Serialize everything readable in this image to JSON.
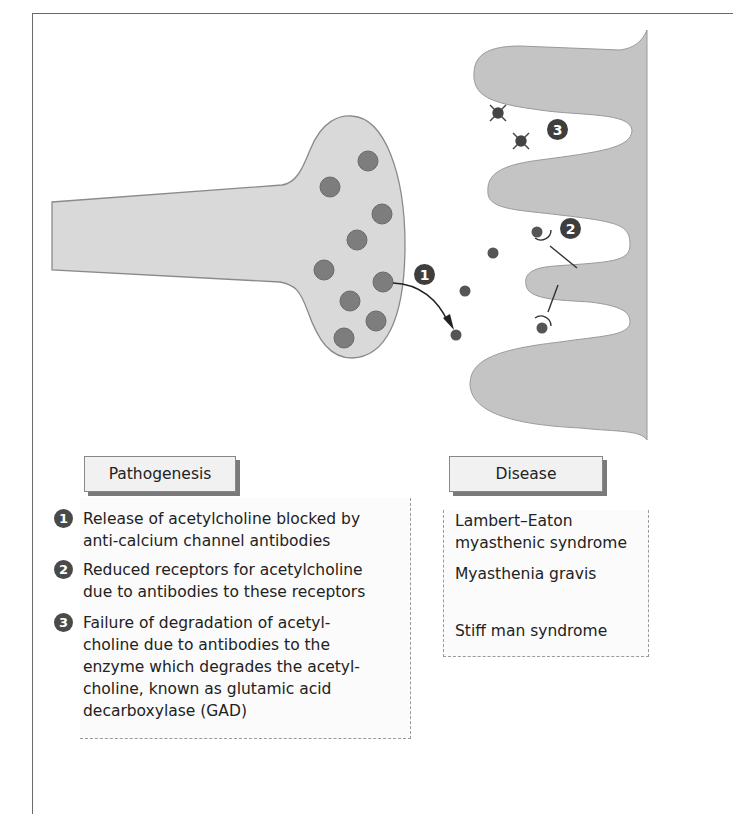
{
  "diagram": {
    "callouts": [
      {
        "label": "1",
        "meaning": "release-blocked"
      },
      {
        "label": "2",
        "meaning": "receptors-reduced"
      },
      {
        "label": "3",
        "meaning": "degradation-failure"
      }
    ],
    "colors": {
      "cell_fill": "#d9d9d9",
      "postsynaptic_fill": "#c3c3c3",
      "vesicle": "#7a7a7a",
      "callout": "#3e3e3e"
    }
  },
  "pathogenesis": {
    "header": "Pathogenesis",
    "items": [
      {
        "num": "1",
        "text": "Release of acetylcholine blocked by\nanti-calcium channel antibodies"
      },
      {
        "num": "2",
        "text": "Reduced receptors for acetylcholine\ndue to antibodies to these receptors"
      },
      {
        "num": "3",
        "text": "Failure of degradation of acetyl-\ncholine due to antibodies to the\nenzyme which degrades the acetyl-\ncholine, known as glutamic acid\ndecarboxylase (GAD)"
      }
    ]
  },
  "disease": {
    "header": "Disease",
    "items": [
      {
        "text": "Lambert–Eaton\nmyasthenic syndrome"
      },
      {
        "text": "Myasthenia gravis"
      },
      {
        "text": "Stiff man syndrome"
      }
    ]
  }
}
